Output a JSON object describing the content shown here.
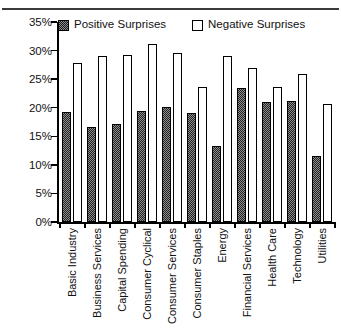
{
  "chart_data": {
    "type": "bar",
    "title": "",
    "subtitle": "",
    "xlabel": "",
    "ylabel": "",
    "ylim": [
      0,
      35
    ],
    "ytick_labels": [
      "35%",
      "30%",
      "25%",
      "20%",
      "15%",
      "10%",
      "5%",
      "0%"
    ],
    "ytick_values": [
      35,
      30,
      25,
      20,
      15,
      10,
      5,
      0
    ],
    "grid": false,
    "legend_position": "top",
    "categories": [
      "Basic Industry",
      "Business Services",
      "Capital Spending",
      "Consumer Cyclical",
      "Consumer Services",
      "Consumer Staples",
      "Energy",
      "Financial Services",
      "Health Care",
      "Technology",
      "Utilities"
    ],
    "series": [
      {
        "name": "Positive Surprises",
        "values": [
          19.3,
          16.7,
          17.1,
          19.4,
          20.2,
          19.0,
          13.3,
          23.4,
          21.0,
          21.1,
          11.6
        ]
      },
      {
        "name": "Negative Surprises",
        "values": [
          27.9,
          29.1,
          29.2,
          31.1,
          29.6,
          23.7,
          29.1,
          26.9,
          23.6,
          25.9,
          20.6
        ]
      }
    ]
  },
  "legend": {
    "entries": [
      {
        "label": "Positive Surprises",
        "swatch": "hatched-dark-square",
        "color": "#8e8e8e"
      },
      {
        "label": "Negative Surprises",
        "swatch": "white-outline-square",
        "color": "#ffffff"
      }
    ]
  },
  "axis": {
    "line_color": "#000000"
  }
}
